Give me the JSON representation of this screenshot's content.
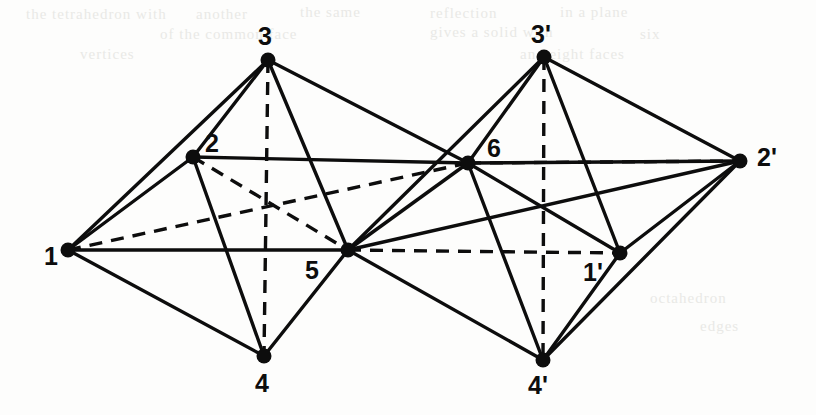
{
  "figure": {
    "type": "geometry-diagram",
    "width": 816,
    "height": 415,
    "background_color": "#fdfdfc",
    "ink_color": "#0d0d0d",
    "vertices": [
      {
        "id": "v1",
        "label": "1",
        "x": 68,
        "y": 250,
        "label_x": 44,
        "label_y": 265
      },
      {
        "id": "v2",
        "label": "2",
        "x": 193,
        "y": 157,
        "label_x": 205,
        "label_y": 152
      },
      {
        "id": "v3",
        "label": "3",
        "x": 268,
        "y": 60,
        "label_x": 258,
        "label_y": 45
      },
      {
        "id": "v4",
        "label": "4",
        "x": 264,
        "y": 356,
        "label_x": 255,
        "label_y": 392
      },
      {
        "id": "v5",
        "label": "5",
        "x": 348,
        "y": 250,
        "label_x": 305,
        "label_y": 279
      },
      {
        "id": "v6",
        "label": "6",
        "x": 468,
        "y": 163,
        "label_x": 487,
        "label_y": 157
      },
      {
        "id": "v3p",
        "label": "3'",
        "x": 544,
        "y": 57,
        "label_x": 531,
        "label_y": 43
      },
      {
        "id": "v2p",
        "label": "2'",
        "x": 740,
        "y": 161,
        "label_x": 757,
        "label_y": 166
      },
      {
        "id": "v1p",
        "label": "1'",
        "x": 620,
        "y": 253,
        "label_x": 583,
        "label_y": 281
      },
      {
        "id": "v4p",
        "label": "4'",
        "x": 543,
        "y": 360,
        "label_x": 528,
        "label_y": 394
      }
    ],
    "edges_visible": [
      {
        "from": "v1",
        "to": "v2"
      },
      {
        "from": "v1",
        "to": "v3"
      },
      {
        "from": "v1",
        "to": "v4"
      },
      {
        "from": "v1",
        "to": "v5"
      },
      {
        "from": "v2",
        "to": "v3"
      },
      {
        "from": "v2",
        "to": "v4"
      },
      {
        "from": "v2",
        "to": "v6"
      },
      {
        "from": "v3",
        "to": "v5"
      },
      {
        "from": "v3",
        "to": "v6"
      },
      {
        "from": "v4",
        "to": "v5"
      },
      {
        "from": "v5",
        "to": "v6"
      },
      {
        "from": "v6",
        "to": "v3p"
      },
      {
        "from": "v6",
        "to": "v4p"
      },
      {
        "from": "v6",
        "to": "v2p"
      },
      {
        "from": "v6",
        "to": "v1p"
      },
      {
        "from": "v5",
        "to": "v3p"
      },
      {
        "from": "v5",
        "to": "v4p"
      },
      {
        "from": "v5",
        "to": "v2p"
      },
      {
        "from": "v3p",
        "to": "v2p"
      },
      {
        "from": "v3p",
        "to": "v1p"
      },
      {
        "from": "v4p",
        "to": "v2p"
      },
      {
        "from": "v4p",
        "to": "v1p"
      },
      {
        "from": "v1p",
        "to": "v2p"
      }
    ],
    "edges_hidden": [
      {
        "from": "v3",
        "to": "v4"
      },
      {
        "from": "v1",
        "to": "v6"
      },
      {
        "from": "v2",
        "to": "v5"
      },
      {
        "from": "v3p",
        "to": "v4p"
      },
      {
        "from": "v5",
        "to": "v1p"
      },
      {
        "from": "v6",
        "to": "v2p"
      }
    ]
  },
  "artifacts": {
    "note": "faint reverse-side text bleed-through from the scanned page",
    "lines": [
      {
        "text": "the tetrahedron with",
        "x": 26,
        "y": 6
      },
      {
        "text": "another",
        "x": 196,
        "y": 6
      },
      {
        "text": "the same",
        "x": 300,
        "y": 4
      },
      {
        "text": "reflection",
        "x": 430,
        "y": 5
      },
      {
        "text": "in a plane",
        "x": 560,
        "y": 4
      },
      {
        "text": "of the common face",
        "x": 160,
        "y": 26
      },
      {
        "text": "gives a solid with",
        "x": 430,
        "y": 24
      },
      {
        "text": "six",
        "x": 640,
        "y": 26
      },
      {
        "text": "vertices",
        "x": 80,
        "y": 46
      },
      {
        "text": "and eight faces",
        "x": 520,
        "y": 46
      },
      {
        "text": "octahedron",
        "x": 650,
        "y": 290
      },
      {
        "text": "edges",
        "x": 700,
        "y": 318
      }
    ]
  }
}
